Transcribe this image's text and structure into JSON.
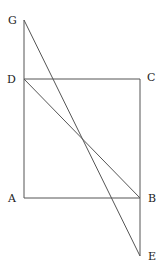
{
  "diagram": {
    "type": "geometry",
    "points": {
      "G": {
        "label": "G",
        "x": 24,
        "y": 20
      },
      "D": {
        "label": "D",
        "x": 24,
        "y": 79
      },
      "C": {
        "label": "C",
        "x": 140,
        "y": 79
      },
      "A": {
        "label": "A",
        "x": 24,
        "y": 198
      },
      "B": {
        "label": "B",
        "x": 140,
        "y": 198
      },
      "E": {
        "label": "E",
        "x": 140,
        "y": 256
      }
    },
    "segments": [
      [
        "G",
        "A"
      ],
      [
        "D",
        "C"
      ],
      [
        "C",
        "E"
      ],
      [
        "A",
        "B"
      ],
      [
        "G",
        "E"
      ],
      [
        "D",
        "B"
      ]
    ],
    "labels": {
      "G": "G",
      "D": "D",
      "C": "C",
      "A": "A",
      "B": "B",
      "E": "E"
    }
  }
}
